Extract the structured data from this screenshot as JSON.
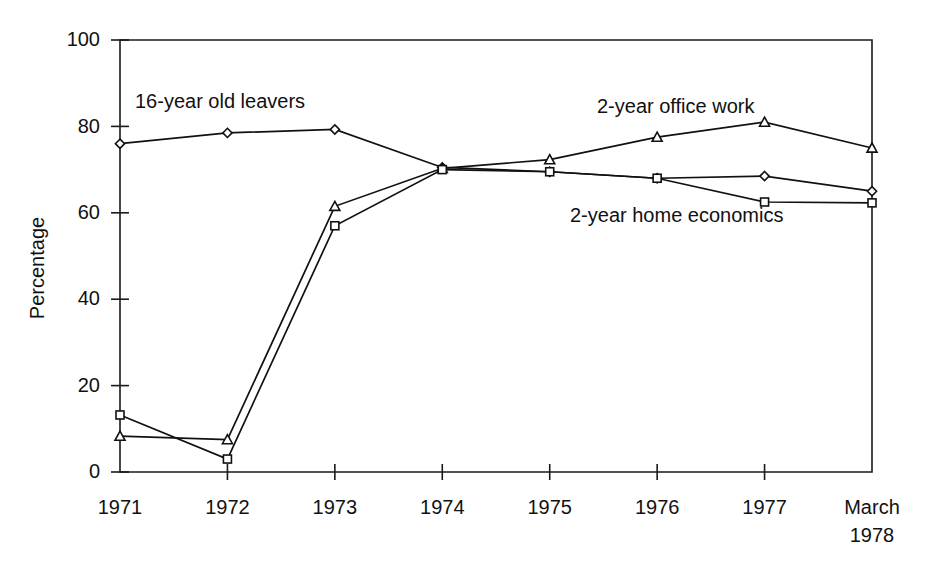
{
  "chart_data": {
    "type": "line",
    "title": "",
    "xlabel": "",
    "ylabel": "Percentage",
    "ylim": [
      0,
      100
    ],
    "yticks": [
      0,
      20,
      40,
      60,
      80,
      100
    ],
    "ytick_labels": [
      "0",
      "20",
      "40",
      "60",
      "80",
      "100"
    ],
    "grid": false,
    "legend_position": "inline-annotations",
    "categories": [
      "1971",
      "1972",
      "1973",
      "1974",
      "1975",
      "1976",
      "1977",
      "March 1978"
    ],
    "xtick_labels": [
      {
        "line1": "1971",
        "line2": ""
      },
      {
        "line1": "1972",
        "line2": ""
      },
      {
        "line1": "1973",
        "line2": ""
      },
      {
        "line1": "1974",
        "line2": ""
      },
      {
        "line1": "1975",
        "line2": ""
      },
      {
        "line1": "1976",
        "line2": ""
      },
      {
        "line1": "1977",
        "line2": ""
      },
      {
        "line1": "March",
        "line2": "1978"
      }
    ],
    "series": [
      {
        "name": "16-year old leavers",
        "marker": "diamond",
        "values": [
          76,
          78.5,
          79.3,
          70.5,
          69.5,
          68,
          68.5,
          65
        ]
      },
      {
        "name": "2-year office work",
        "marker": "triangle",
        "values": [
          8.3,
          7.5,
          61.5,
          70.3,
          72.3,
          77.5,
          81,
          75
        ]
      },
      {
        "name": "2-year home economics",
        "marker": "square",
        "values": [
          13.2,
          3,
          57,
          70,
          69.5,
          68,
          62.5,
          62.3
        ]
      }
    ],
    "annotations": [
      {
        "text": "16-year old leavers",
        "x_px": 135,
        "y_px": 108
      },
      {
        "text": "2-year office work",
        "x_px": 597,
        "y_px": 113
      },
      {
        "text": "2-year home economics",
        "x_px": 570,
        "y_px": 222
      }
    ]
  }
}
